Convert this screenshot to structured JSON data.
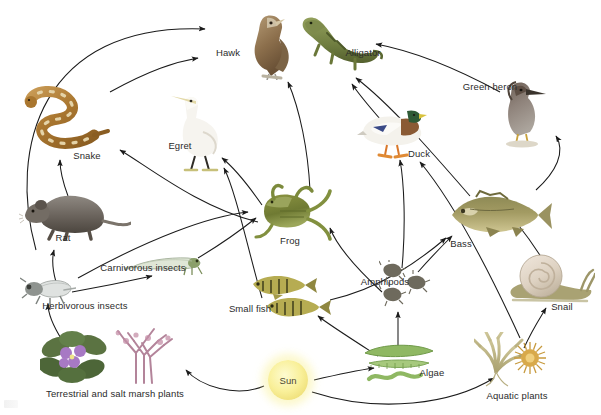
{
  "diagram": {
    "background": "#ffffff",
    "arrow_color": "#1b1b1b",
    "label_color": "#2b2b2b",
    "width": 601,
    "height": 415
  },
  "nodes": [
    {
      "id": "hawk",
      "label": "Hawk",
      "label_x": 228,
      "label_y": 52,
      "img_x": 268,
      "img_y": 45,
      "w": 62,
      "h": 70,
      "kind": "bird-of-prey"
    },
    {
      "id": "alligator",
      "label": "Alligator",
      "label_x": 363,
      "label_y": 52,
      "img_x": 340,
      "img_y": 42,
      "w": 86,
      "h": 62,
      "kind": "reptile"
    },
    {
      "id": "green_heron",
      "label": "Green heron",
      "label_x": 490,
      "label_y": 86,
      "img_x": 519,
      "img_y": 110,
      "w": 62,
      "h": 76,
      "kind": "wading-bird"
    },
    {
      "id": "snake",
      "label": "Snake",
      "label_x": 87,
      "label_y": 155,
      "img_x": 70,
      "img_y": 120,
      "w": 96,
      "h": 70,
      "kind": "reptile"
    },
    {
      "id": "egret",
      "label": "Egret",
      "label_x": 180,
      "label_y": 145,
      "img_x": 198,
      "img_y": 130,
      "w": 70,
      "h": 84,
      "kind": "wading-bird"
    },
    {
      "id": "duck",
      "label": "Duck",
      "label_x": 419,
      "label_y": 153,
      "img_x": 392,
      "img_y": 130,
      "w": 70,
      "h": 58,
      "kind": "waterfowl"
    },
    {
      "id": "rat",
      "label": "Rat",
      "label_x": 63,
      "label_y": 237,
      "img_x": 75,
      "img_y": 212,
      "w": 112,
      "h": 58,
      "kind": "mammal"
    },
    {
      "id": "frog",
      "label": "Frog",
      "label_x": 290,
      "label_y": 240,
      "img_x": 292,
      "img_y": 212,
      "w": 84,
      "h": 62,
      "kind": "amphibian"
    },
    {
      "id": "bass",
      "label": "Bass",
      "label_x": 461,
      "label_y": 243,
      "img_x": 500,
      "img_y": 215,
      "w": 108,
      "h": 56,
      "kind": "fish"
    },
    {
      "id": "carniv_insects",
      "label": "Carnivorous insects",
      "label_x": 143,
      "label_y": 267,
      "img_x": 165,
      "img_y": 263,
      "w": 82,
      "h": 28,
      "kind": "insect"
    },
    {
      "id": "amphipods",
      "label": "Amphipods",
      "label_x": 385,
      "label_y": 281,
      "img_x": 405,
      "img_y": 285,
      "w": 52,
      "h": 50,
      "kind": "crustacean"
    },
    {
      "id": "snail",
      "label": "Snail",
      "label_x": 562,
      "label_y": 306,
      "img_x": 551,
      "img_y": 280,
      "w": 88,
      "h": 52,
      "kind": "mollusc"
    },
    {
      "id": "herb_insects",
      "label": "Herbivorous insects",
      "label_x": 85,
      "label_y": 305,
      "img_x": 48,
      "img_y": 288,
      "w": 56,
      "h": 36,
      "kind": "insect"
    },
    {
      "id": "small_fish",
      "label": "Small fish",
      "label_x": 250,
      "label_y": 308,
      "img_x": 290,
      "img_y": 296,
      "w": 86,
      "h": 48,
      "kind": "fish"
    },
    {
      "id": "terr_plants",
      "label": "Terrestrial and salt marsh plants",
      "label_x": 115,
      "label_y": 393,
      "img_x": 110,
      "img_y": 357,
      "w": 140,
      "h": 60,
      "kind": "plant"
    },
    {
      "id": "algae",
      "label": "Algae",
      "label_x": 432,
      "label_y": 372,
      "img_x": 400,
      "img_y": 363,
      "w": 78,
      "h": 48,
      "kind": "algae"
    },
    {
      "id": "aquatic_plants",
      "label": "Aquatic plants",
      "label_x": 517,
      "label_y": 395,
      "img_x": 510,
      "img_y": 360,
      "w": 72,
      "h": 56,
      "kind": "plant"
    },
    {
      "id": "sun",
      "label": "Sun",
      "label_x": 288,
      "label_y": 380,
      "img_x": 288,
      "img_y": 380,
      "w": 40,
      "h": 40,
      "kind": "sun"
    }
  ],
  "flows": [
    {
      "from": "rat",
      "to": "hawk",
      "note": "rat eaten by hawk"
    },
    {
      "from": "snake",
      "to": "hawk",
      "note": "snake eaten by hawk"
    },
    {
      "from": "rat",
      "to": "snake",
      "note": "rat eaten by snake"
    },
    {
      "from": "frog",
      "to": "snake",
      "note": "frog eaten by snake"
    },
    {
      "from": "frog",
      "to": "egret",
      "note": "frog eaten by egret"
    },
    {
      "from": "small_fish",
      "to": "egret",
      "note": "small fish eaten by egret"
    },
    {
      "from": "frog",
      "to": "alligator",
      "note": "frog eaten by alligator"
    },
    {
      "from": "duck",
      "to": "alligator",
      "note": "duck eaten by alligator"
    },
    {
      "from": "bass",
      "to": "alligator",
      "note": "bass eaten by alligator"
    },
    {
      "from": "bass",
      "to": "green_heron",
      "note": "bass eaten by green heron"
    },
    {
      "from": "green_heron",
      "to": "alligator",
      "note": "green heron eaten by alligator"
    },
    {
      "from": "amphipods",
      "to": "duck",
      "note": "amphipods eaten by duck"
    },
    {
      "from": "aquatic_plants",
      "to": "duck",
      "note": "aquatic plants eaten by duck"
    },
    {
      "from": "carniv_insects",
      "to": "frog",
      "note": "carnivorous insects eaten by frog"
    },
    {
      "from": "herb_insects",
      "to": "frog",
      "note": "herbivorous insects eaten by frog"
    },
    {
      "from": "amphipods",
      "to": "frog",
      "note": "amphipods eaten by frog"
    },
    {
      "from": "herb_insects",
      "to": "carniv_insects",
      "note": "herbivorous insects eaten by carnivorous insects"
    },
    {
      "from": "herb_insects",
      "to": "rat",
      "note": "herbivorous insects eaten by rat"
    },
    {
      "from": "terr_plants",
      "to": "herb_insects",
      "note": "plants eaten by herbivorous insects"
    },
    {
      "from": "small_fish",
      "to": "bass",
      "note": "small fish eaten by bass"
    },
    {
      "from": "amphipods",
      "to": "bass",
      "note": "amphipods eaten by bass"
    },
    {
      "from": "snail",
      "to": "bass",
      "note": "snail eaten by bass"
    },
    {
      "from": "algae",
      "to": "small_fish",
      "note": "algae eaten by small fish"
    },
    {
      "from": "algae",
      "to": "amphipods",
      "note": "algae eaten by amphipods"
    },
    {
      "from": "aquatic_plants",
      "to": "snail",
      "note": "aquatic plants eaten by snail"
    },
    {
      "from": "sun",
      "to": "algae",
      "note": "sunlight powers algae"
    },
    {
      "from": "sun",
      "to": "aquatic_plants",
      "note": "sunlight powers aquatic plants"
    },
    {
      "from": "sun",
      "to": "terr_plants",
      "note": "sunlight powers terrestrial plants"
    }
  ]
}
